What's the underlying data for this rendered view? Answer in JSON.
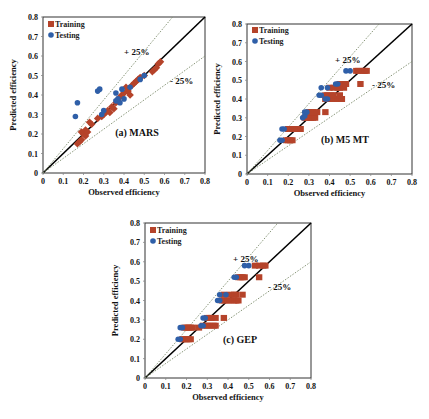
{
  "colors": {
    "training": "#b5432a",
    "testing": "#2f5fa8",
    "ideal_line": "#000000",
    "band_line": "#7a8a6a"
  },
  "chart_data": [
    {
      "type": "scatter",
      "panel_label": "(a) MARS",
      "xlabel": "Observed efficiency",
      "ylabel": "Predicted efficiency",
      "xlim": [
        0,
        0.8
      ],
      "ylim": [
        0,
        0.8
      ],
      "xticks": [
        "0",
        "0.1",
        "0.2",
        "0.3",
        "0.4",
        "0.5",
        "0.6",
        "0.7",
        "0.8"
      ],
      "yticks": [
        "0",
        "0.1",
        "0.2",
        "0.3",
        "0.4",
        "0.5",
        "0.6",
        "0.7",
        "0.8"
      ],
      "legend": [
        "Training",
        "Testing"
      ],
      "legend_position": "top-left",
      "annotations": [
        "+ 25%",
        "- 25%"
      ],
      "reference_lines": [
        {
          "name": "ideal",
          "slope": 1.0
        },
        {
          "name": "+25%",
          "slope": 1.25
        },
        {
          "name": "-25%",
          "slope": 0.75
        }
      ],
      "series": [
        {
          "name": "Training",
          "marker": "diamond",
          "points": [
            [
              0.17,
              0.15
            ],
            [
              0.18,
              0.16
            ],
            [
              0.19,
              0.17
            ],
            [
              0.19,
              0.21
            ],
            [
              0.2,
              0.2
            ],
            [
              0.21,
              0.22
            ],
            [
              0.21,
              0.19
            ],
            [
              0.22,
              0.21
            ],
            [
              0.23,
              0.26
            ],
            [
              0.24,
              0.25
            ],
            [
              0.27,
              0.28
            ],
            [
              0.29,
              0.29
            ],
            [
              0.3,
              0.3
            ],
            [
              0.31,
              0.31
            ],
            [
              0.32,
              0.32
            ],
            [
              0.33,
              0.31
            ],
            [
              0.34,
              0.34
            ],
            [
              0.35,
              0.33
            ],
            [
              0.36,
              0.36
            ],
            [
              0.37,
              0.37
            ],
            [
              0.38,
              0.39
            ],
            [
              0.39,
              0.4
            ],
            [
              0.4,
              0.41
            ],
            [
              0.41,
              0.44
            ],
            [
              0.42,
              0.42
            ],
            [
              0.43,
              0.4
            ],
            [
              0.44,
              0.45
            ],
            [
              0.45,
              0.46
            ],
            [
              0.46,
              0.47
            ],
            [
              0.47,
              0.48
            ],
            [
              0.48,
              0.49
            ],
            [
              0.5,
              0.5
            ],
            [
              0.54,
              0.52
            ],
            [
              0.55,
              0.53
            ],
            [
              0.56,
              0.54
            ],
            [
              0.57,
              0.56
            ],
            [
              0.58,
              0.57
            ]
          ]
        },
        {
          "name": "Testing",
          "marker": "circle",
          "points": [
            [
              0.16,
              0.29
            ],
            [
              0.17,
              0.36
            ],
            [
              0.27,
              0.42
            ],
            [
              0.28,
              0.43
            ],
            [
              0.29,
              0.3
            ],
            [
              0.3,
              0.32
            ],
            [
              0.36,
              0.37
            ],
            [
              0.36,
              0.41
            ],
            [
              0.37,
              0.38
            ],
            [
              0.38,
              0.36
            ],
            [
              0.39,
              0.43
            ],
            [
              0.4,
              0.38
            ],
            [
              0.43,
              0.44
            ],
            [
              0.48,
              0.48
            ],
            [
              0.5,
              0.5
            ]
          ]
        }
      ]
    },
    {
      "type": "scatter",
      "panel_label": "(b) M5 MT",
      "xlabel": "Observed efficiency",
      "ylabel": "Predicted efficiency",
      "xlim": [
        0,
        0.8
      ],
      "ylim": [
        0,
        0.8
      ],
      "xticks": [
        "0",
        "0.1",
        "0.2",
        "0.3",
        "0.4",
        "0.5",
        "0.6",
        "0.7",
        "0.8"
      ],
      "yticks": [
        "0",
        "0.1",
        "0.2",
        "0.3",
        "0.4",
        "0.5",
        "0.6",
        "0.7",
        "0.8"
      ],
      "legend": [
        "Training",
        "Testing"
      ],
      "legend_position": "top-left",
      "annotations": [
        "+ 25%",
        "- 25%"
      ],
      "reference_lines": [
        {
          "name": "ideal",
          "slope": 1.0
        },
        {
          "name": "+25%",
          "slope": 1.25
        },
        {
          "name": "-25%",
          "slope": 0.75
        }
      ],
      "series": [
        {
          "name": "Training",
          "marker": "square",
          "points": [
            [
              0.19,
              0.18
            ],
            [
              0.2,
              0.18
            ],
            [
              0.21,
              0.18
            ],
            [
              0.22,
              0.18
            ],
            [
              0.2,
              0.24
            ],
            [
              0.21,
              0.24
            ],
            [
              0.22,
              0.24
            ],
            [
              0.23,
              0.24
            ],
            [
              0.24,
              0.24
            ],
            [
              0.26,
              0.24
            ],
            [
              0.28,
              0.3
            ],
            [
              0.29,
              0.3
            ],
            [
              0.3,
              0.3
            ],
            [
              0.31,
              0.3
            ],
            [
              0.32,
              0.3
            ],
            [
              0.33,
              0.3
            ],
            [
              0.3,
              0.33
            ],
            [
              0.31,
              0.33
            ],
            [
              0.32,
              0.33
            ],
            [
              0.34,
              0.33
            ],
            [
              0.38,
              0.33
            ],
            [
              0.38,
              0.4
            ],
            [
              0.4,
              0.4
            ],
            [
              0.41,
              0.4
            ],
            [
              0.42,
              0.4
            ],
            [
              0.44,
              0.4
            ],
            [
              0.45,
              0.4
            ],
            [
              0.46,
              0.4
            ],
            [
              0.38,
              0.42
            ],
            [
              0.39,
              0.42
            ],
            [
              0.41,
              0.42
            ],
            [
              0.42,
              0.42
            ],
            [
              0.45,
              0.42
            ],
            [
              0.4,
              0.46
            ],
            [
              0.42,
              0.46
            ],
            [
              0.44,
              0.46
            ],
            [
              0.45,
              0.46
            ],
            [
              0.47,
              0.46
            ],
            [
              0.45,
              0.48
            ],
            [
              0.46,
              0.48
            ],
            [
              0.47,
              0.48
            ],
            [
              0.48,
              0.48
            ],
            [
              0.55,
              0.48
            ],
            [
              0.53,
              0.55
            ],
            [
              0.54,
              0.55
            ],
            [
              0.56,
              0.55
            ],
            [
              0.57,
              0.55
            ],
            [
              0.58,
              0.55
            ]
          ]
        },
        {
          "name": "Testing",
          "marker": "circle",
          "points": [
            [
              0.16,
              0.18
            ],
            [
              0.17,
              0.18
            ],
            [
              0.17,
              0.24
            ],
            [
              0.18,
              0.24
            ],
            [
              0.27,
              0.3
            ],
            [
              0.28,
              0.31
            ],
            [
              0.28,
              0.33
            ],
            [
              0.29,
              0.33
            ],
            [
              0.35,
              0.42
            ],
            [
              0.36,
              0.42
            ],
            [
              0.36,
              0.46
            ],
            [
              0.39,
              0.46
            ],
            [
              0.38,
              0.4
            ],
            [
              0.39,
              0.4
            ],
            [
              0.43,
              0.48
            ],
            [
              0.44,
              0.48
            ],
            [
              0.48,
              0.55
            ],
            [
              0.5,
              0.55
            ]
          ]
        }
      ]
    },
    {
      "type": "scatter",
      "panel_label": "(c) GEP",
      "xlabel": "Observed efficiency",
      "ylabel": "Predicted efficiency",
      "xlim": [
        0,
        0.8
      ],
      "ylim": [
        0,
        0.8
      ],
      "xticks": [
        "0",
        "0.1",
        "0.2",
        "0.3",
        "0.4",
        "0.5",
        "0.6",
        "0.7",
        "0.8"
      ],
      "yticks": [
        "0",
        "0.1",
        "0.2",
        "0.3",
        "0.4",
        "0.5",
        "0.6",
        "0.7",
        "0.8"
      ],
      "legend": [
        "Training",
        "Testing"
      ],
      "legend_position": "top-left",
      "annotations": [
        "+ 25%",
        "- 25%"
      ],
      "reference_lines": [
        {
          "name": "ideal",
          "slope": 1.0
        },
        {
          "name": "+25%",
          "slope": 1.25
        },
        {
          "name": "-25%",
          "slope": 0.75
        }
      ],
      "series": [
        {
          "name": "Training",
          "marker": "square",
          "points": [
            [
              0.18,
              0.2
            ],
            [
              0.19,
              0.2
            ],
            [
              0.2,
              0.2
            ],
            [
              0.21,
              0.2
            ],
            [
              0.22,
              0.2
            ],
            [
              0.19,
              0.26
            ],
            [
              0.2,
              0.26
            ],
            [
              0.21,
              0.26
            ],
            [
              0.22,
              0.26
            ],
            [
              0.23,
              0.26
            ],
            [
              0.26,
              0.26
            ],
            [
              0.28,
              0.27
            ],
            [
              0.3,
              0.27
            ],
            [
              0.31,
              0.27
            ],
            [
              0.33,
              0.27
            ],
            [
              0.34,
              0.27
            ],
            [
              0.3,
              0.31
            ],
            [
              0.31,
              0.31
            ],
            [
              0.32,
              0.31
            ],
            [
              0.34,
              0.31
            ],
            [
              0.38,
              0.31
            ],
            [
              0.37,
              0.4
            ],
            [
              0.38,
              0.4
            ],
            [
              0.4,
              0.4
            ],
            [
              0.41,
              0.4
            ],
            [
              0.43,
              0.4
            ],
            [
              0.44,
              0.4
            ],
            [
              0.45,
              0.4
            ],
            [
              0.38,
              0.43
            ],
            [
              0.41,
              0.43
            ],
            [
              0.43,
              0.43
            ],
            [
              0.44,
              0.43
            ],
            [
              0.47,
              0.43
            ],
            [
              0.45,
              0.52
            ],
            [
              0.46,
              0.52
            ],
            [
              0.47,
              0.52
            ],
            [
              0.48,
              0.52
            ],
            [
              0.55,
              0.52
            ],
            [
              0.53,
              0.58
            ],
            [
              0.55,
              0.58
            ],
            [
              0.57,
              0.58
            ],
            [
              0.58,
              0.58
            ]
          ]
        },
        {
          "name": "Testing",
          "marker": "circle",
          "points": [
            [
              0.16,
              0.2
            ],
            [
              0.17,
              0.2
            ],
            [
              0.17,
              0.26
            ],
            [
              0.18,
              0.26
            ],
            [
              0.27,
              0.27
            ],
            [
              0.28,
              0.27
            ],
            [
              0.28,
              0.31
            ],
            [
              0.29,
              0.31
            ],
            [
              0.35,
              0.4
            ],
            [
              0.36,
              0.4
            ],
            [
              0.36,
              0.43
            ],
            [
              0.39,
              0.43
            ],
            [
              0.43,
              0.52
            ],
            [
              0.44,
              0.52
            ],
            [
              0.48,
              0.58
            ],
            [
              0.5,
              0.58
            ]
          ]
        }
      ]
    }
  ]
}
